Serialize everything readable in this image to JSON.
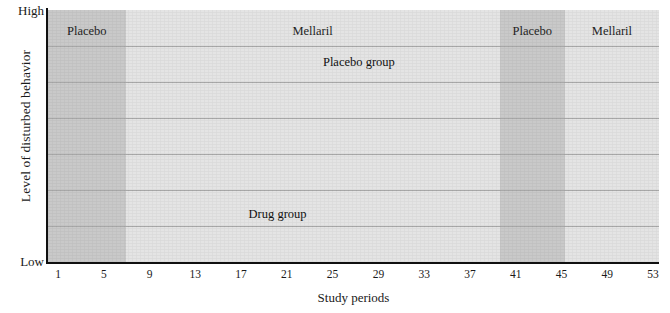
{
  "chart_data": {
    "type": "line",
    "title": "",
    "xlabel": "Study periods",
    "ylabel": "Level of disturbed behavior",
    "y_axis_top_label": "High",
    "y_axis_bottom_label": "Low",
    "grid": true,
    "gridlines": 6,
    "legend_position": "inline-annotation",
    "xlim": [
      1,
      53
    ],
    "ylim": [
      0,
      100
    ],
    "xticks": [
      1,
      5,
      9,
      13,
      17,
      21,
      25,
      29,
      33,
      37,
      41,
      45,
      49,
      53
    ],
    "x": [
      1,
      2,
      3,
      4,
      5,
      6,
      7,
      8,
      9,
      10,
      11,
      12,
      13,
      14,
      15,
      16,
      17,
      18,
      19,
      20,
      21,
      22,
      23,
      24,
      25,
      26,
      27,
      28,
      29,
      30,
      31,
      32,
      33,
      34,
      35,
      36,
      37,
      38,
      39,
      40,
      41,
      42,
      43,
      44,
      45,
      46,
      47,
      48,
      49,
      50,
      51,
      52,
      53
    ],
    "series": [
      {
        "name": "Placebo group",
        "color": "#5a5a5a",
        "marker_color": "#111111",
        "values": [
          62,
          63,
          51,
          68,
          58,
          78,
          91,
          84,
          65,
          63,
          69,
          76,
          62,
          62,
          59,
          77,
          75,
          69,
          70,
          58,
          81,
          81,
          49,
          64,
          69,
          63,
          70,
          68,
          61,
          61,
          35,
          84,
          71,
          77,
          63,
          64,
          64,
          59,
          71,
          65,
          75,
          62,
          71,
          58,
          80,
          61,
          70,
          71,
          71,
          80,
          64,
          73,
          86
        ]
      },
      {
        "name": "Drug group",
        "color": "#5a5a5a",
        "marker_color": "#111111",
        "values": [
          45,
          38,
          48,
          54,
          58,
          72,
          82,
          67,
          64,
          68,
          60,
          52,
          47,
          38,
          36,
          39,
          33,
          30,
          30,
          39,
          31,
          27,
          29,
          34,
          37,
          29,
          38,
          55,
          48,
          43,
          31,
          27,
          34,
          30,
          37,
          41,
          31,
          22,
          30,
          26,
          37,
          44,
          55,
          59,
          60,
          57,
          63,
          68,
          59,
          53,
          43,
          41,
          42
        ]
      }
    ],
    "bands": [
      {
        "label": "Placebo",
        "x_start": 1,
        "x_end": 6.9,
        "shade": "dark"
      },
      {
        "label": "Mellaril",
        "x_start": 6.9,
        "x_end": 39.6,
        "shade": "light"
      },
      {
        "label": "Placebo",
        "x_start": 39.6,
        "x_end": 45.3,
        "shade": "dark"
      },
      {
        "label": "Mellaril",
        "x_start": 45.3,
        "x_end": 53,
        "shade": "light"
      }
    ],
    "annotations": [
      {
        "text": "Placebo group",
        "x": 28.0,
        "y": 82
      },
      {
        "text": "Drug group",
        "x": 21.5,
        "y": 17
      }
    ]
  }
}
